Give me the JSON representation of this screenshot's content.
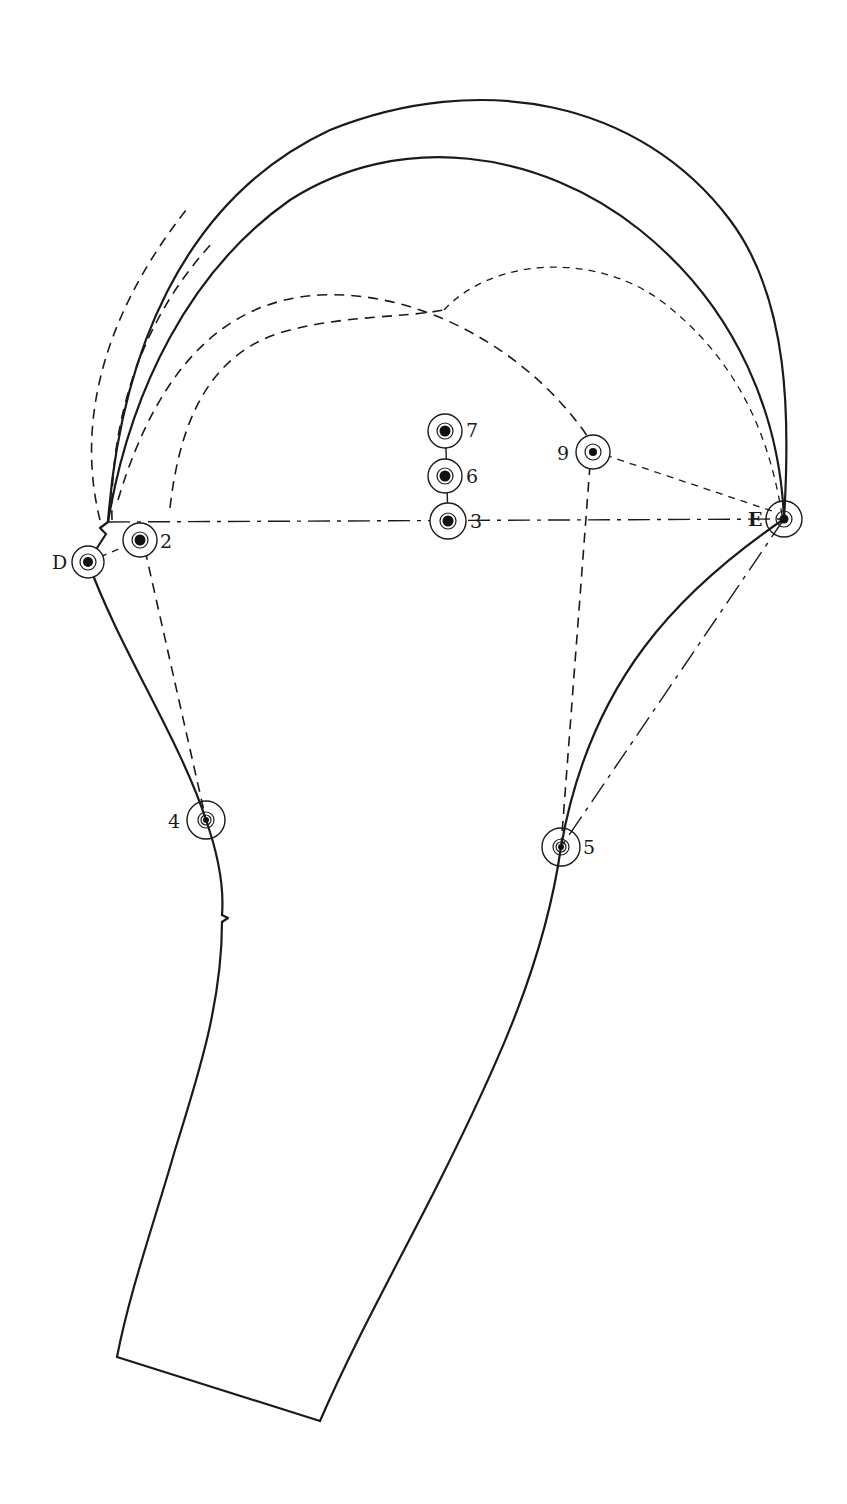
{
  "diagram": {
    "type": "sleeve-pattern-draft",
    "points": [
      {
        "id": "D",
        "label": "D",
        "x": 88,
        "y": 562
      },
      {
        "id": "2",
        "label": "2",
        "x": 140,
        "y": 540
      },
      {
        "id": "3",
        "label": "3",
        "x": 448,
        "y": 521
      },
      {
        "id": "6",
        "label": "6",
        "x": 445,
        "y": 476
      },
      {
        "id": "7",
        "label": "7",
        "x": 445,
        "y": 431
      },
      {
        "id": "9",
        "label": "9",
        "x": 593,
        "y": 452
      },
      {
        "id": "E",
        "label": "E",
        "x": 784,
        "y": 519
      },
      {
        "id": "4",
        "label": "4",
        "x": 206,
        "y": 820
      },
      {
        "id": "5",
        "label": "5",
        "x": 561,
        "y": 847
      }
    ],
    "colors": {
      "ink": "#1a1a1a",
      "paper": "#ffffff"
    }
  }
}
